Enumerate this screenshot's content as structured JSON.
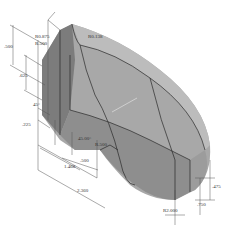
{
  "drawing": {
    "type": "isometric-part-drawing",
    "colors": {
      "background": "#ffffff",
      "face_light": "#b4b4b4",
      "face_mid": "#9a9a9a",
      "face_dark": "#7c7c7c",
      "edge": "#2a2a2a",
      "dimension": "#555555"
    },
    "dimensions": [
      {
        "id": "d-top-radius-1",
        "text": "R0.875"
      },
      {
        "id": "d-top-radius-2",
        "text": "R.500"
      },
      {
        "id": "d-top-right-radius",
        "text": "R0.138"
      },
      {
        "id": "d-left-height",
        "text": ".500"
      },
      {
        "id": "d-left-mid",
        "text": ".625"
      },
      {
        "id": "d-left-chamfer",
        "text": "45°"
      },
      {
        "id": "d-left-offset",
        "text": ".225"
      },
      {
        "id": "d-angle",
        "text": "45.00°"
      },
      {
        "id": "d-inner-radius",
        "text": "R.500"
      },
      {
        "id": "d-step",
        "text": ".500"
      },
      {
        "id": "d-length-mid",
        "text": "1.468"
      },
      {
        "id": "d-length-total",
        "text": "2.360"
      },
      {
        "id": "d-right-height",
        "text": ".475"
      },
      {
        "id": "d-right-width",
        "text": ".750"
      },
      {
        "id": "d-bottom-radius",
        "text": "R2.000"
      }
    ]
  }
}
